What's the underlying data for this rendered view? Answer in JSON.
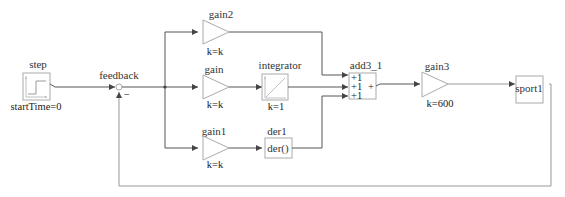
{
  "diagram": {
    "blocks": {
      "step": {
        "name": "step",
        "param": "startTime=0"
      },
      "feedback": {
        "name": "feedback",
        "minus_sign": "−"
      },
      "gain2": {
        "name": "gain2",
        "param": "k=k"
      },
      "gain": {
        "name": "gain",
        "param": "k=k"
      },
      "gain1": {
        "name": "gain1",
        "param": "k=k"
      },
      "integrator": {
        "name": "integrator",
        "param": "k=1"
      },
      "der1": {
        "name": "der1",
        "body": "der()"
      },
      "add3_1": {
        "name": "add3_1",
        "inputs": [
          "+1",
          "+1",
          "+1"
        ],
        "output_sign": "+"
      },
      "gain3": {
        "name": "gain3",
        "param": "k=600"
      },
      "sport1": {
        "name": "sport1"
      }
    },
    "colors": {
      "wire": "#555555",
      "block_border": "#aaaaaa",
      "text": "#333333"
    }
  }
}
